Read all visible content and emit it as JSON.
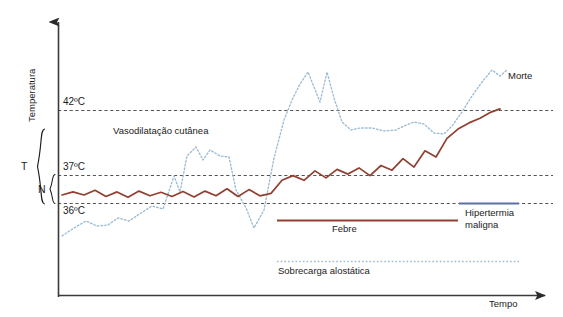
{
  "chart_data": {
    "type": "line",
    "title": "",
    "xlabel": "Tempo",
    "ylabel": "Temperatura",
    "grid": true,
    "legend_position": "inside-bottom",
    "axis": {
      "x_label": "Tempo",
      "y_label": "Temperatura",
      "x_arrow": true,
      "y_arrow": true,
      "x_ticks": [],
      "y_tick_labels": [
        "42ºC",
        "37ºC",
        "36ºC"
      ],
      "y_tick_values": [
        42,
        37,
        36
      ],
      "y_reference_lines": [
        {
          "label": "42ºC",
          "value": 42,
          "style": "dashed",
          "color": "#555555"
        },
        {
          "label": "37ºC",
          "value": 37,
          "style": "dashed",
          "color": "#555555"
        },
        {
          "label": "36ºC",
          "value": 36,
          "style": "dashed",
          "color": "#555555"
        }
      ]
    },
    "brackets": [
      {
        "label": "T",
        "spans": "full temperature range"
      },
      {
        "label": "N",
        "spans": "36ºC to 37ºC normal range"
      }
    ],
    "annotations": [
      {
        "text": "Vasodilatação cutânea",
        "x": 170,
        "y": 131
      },
      {
        "text": "Morte",
        "x": 508,
        "y": 77
      }
    ],
    "series": [
      {
        "name": "Febre",
        "color": "#8f4030",
        "style": "solid",
        "x": [
          62,
          73,
          84,
          95,
          106,
          117,
          128,
          139,
          150,
          161,
          172,
          183,
          194,
          205,
          216,
          227,
          238,
          249,
          260,
          271,
          282,
          293,
          304,
          315,
          326,
          337,
          348,
          359,
          370,
          381,
          392,
          403,
          414,
          425,
          436,
          447,
          458,
          469,
          480,
          491,
          500
        ],
        "y": [
          36.55,
          36.75,
          36.55,
          36.85,
          36.45,
          36.75,
          36.4,
          36.8,
          36.5,
          36.72,
          36.45,
          36.78,
          36.42,
          36.8,
          36.5,
          36.95,
          36.45,
          36.9,
          36.5,
          36.65,
          37.5,
          37.8,
          37.5,
          38.1,
          37.65,
          38.2,
          37.9,
          38.3,
          37.8,
          38.45,
          38.15,
          38.9,
          38.35,
          39.4,
          39.0,
          40.2,
          40.8,
          41.2,
          41.5,
          41.9,
          42.1
        ]
      },
      {
        "name": "Sobrecarga alostática",
        "color": "#9dbcd4",
        "style": "dotted",
        "x": [
          62,
          73,
          84,
          95,
          106,
          117,
          128,
          139,
          150,
          161,
          172,
          183,
          194,
          205,
          216,
          227,
          238,
          249,
          260,
          271,
          282,
          293,
          304,
          315,
          326,
          337,
          348,
          359,
          370,
          381,
          392,
          403,
          414,
          425,
          436,
          447,
          458,
          469,
          480,
          491,
          502
        ],
        "y": [
          34.9,
          35.2,
          35.5,
          35.3,
          35.35,
          35.6,
          35.5,
          35.8,
          36.05,
          35.95,
          37.15,
          36.6,
          37.9,
          38.25,
          37.8,
          38.15,
          37.9,
          36.7,
          35.9,
          35.3,
          35.95,
          37.9,
          39.6,
          41.0,
          42.4,
          43.3,
          42.0,
          43.1,
          42.0,
          42.1,
          42.2,
          42.1,
          42.0,
          42.2,
          42.35,
          42.25,
          42.1,
          42.45,
          42.35,
          43.2,
          43.9
        ]
      }
    ],
    "legend": [
      {
        "label": "Febre",
        "color": "#8f4030",
        "style": "solid"
      },
      {
        "label": "Hipertermia",
        "label2": "maligna",
        "color": "#5d6fa8",
        "style": "solid"
      },
      {
        "label": "Sobrecarga alostática",
        "color": "#9dbcd4",
        "style": "dotted"
      }
    ]
  },
  "axis": {
    "y_title": "Temperatura",
    "x_title": "Tempo",
    "tick_42": "42ºC",
    "tick_37": "37ºC",
    "tick_36": "36ºC"
  },
  "brackets": {
    "total": "T",
    "normal": "N"
  },
  "annotations": {
    "vasodilatacao": "Vasodilatação cutânea",
    "morte": "Morte"
  },
  "legend": {
    "febre": "Febre",
    "hipertermia_line1": "Hipertermia",
    "hipertermia_line2": "maligna",
    "sobrecarga": "Sobrecarga alostática"
  },
  "colors": {
    "febre": "#8f4030",
    "sobrecarga": "#9dbcd4",
    "hipertermia": "#5d6fa8",
    "axis": "#3a3a3a",
    "gridline": "#555555",
    "text": "#1b1b1b"
  }
}
